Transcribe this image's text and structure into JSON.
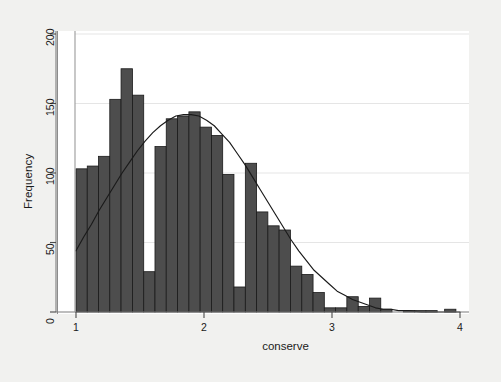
{
  "chart_data": {
    "type": "bar",
    "title": "",
    "subtitle": "",
    "xlabel": "conserve",
    "ylabel": "Frequency",
    "xlim": [
      1.0,
      4.0
    ],
    "ylim": [
      0,
      200
    ],
    "xticks": [
      1,
      2,
      3,
      4
    ],
    "xtick_labels": [
      "1",
      "2",
      "3",
      "4"
    ],
    "yticks": [
      0,
      50,
      100,
      150,
      200
    ],
    "ytick_labels": [
      "0",
      "50",
      "100",
      "150",
      "200"
    ],
    "grid": "horizontal-light",
    "legend": "none",
    "bar_color": "#4d4d4d",
    "bar_edge_color": "#1a1a1a",
    "curve_color": "#1a1a1a",
    "plot_background": "#ffffff",
    "figure_background": "#f1f1ef",
    "bin_width": 0.0455,
    "bin_starts": [
      1.0,
      1.0455,
      1.0909,
      1.1364,
      1.1818,
      1.2273,
      1.2727,
      1.3182,
      1.3636,
      1.4091,
      1.4545,
      1.5,
      1.5455,
      1.5909,
      1.6364,
      1.6818,
      1.7273,
      1.7727,
      1.8182,
      1.8636,
      1.9091,
      1.9545,
      2.0,
      2.0455,
      2.0909,
      2.1364,
      2.1818,
      2.2273,
      2.2727,
      2.3182,
      2.3636,
      2.4091,
      2.4545,
      2.5,
      2.5455,
      2.5909,
      2.6364,
      2.6818,
      2.7273,
      2.7727,
      2.8182,
      2.8636,
      2.9091,
      2.9545,
      3.0,
      3.0455,
      3.0909,
      3.1364,
      3.1818,
      3.2273,
      3.2727,
      3.3182,
      3.3636,
      3.4091,
      3.4545,
      3.5,
      3.5455,
      3.5909,
      3.6364,
      3.6818,
      3.7273,
      3.7727,
      3.8182,
      3.8636,
      3.9091,
      3.9545
    ],
    "values": [
      103,
      105,
      112,
      153,
      175,
      156,
      29,
      119,
      139,
      141,
      144,
      133,
      127,
      99,
      18,
      107,
      72,
      62,
      59,
      33,
      27,
      14,
      3,
      3,
      11,
      4,
      10,
      2,
      1,
      1,
      1,
      2,
      1,
      1
    ],
    "bars": [
      {
        "x0": 1.0,
        "x1": 1.088,
        "height": 103
      },
      {
        "x0": 1.088,
        "x1": 1.176,
        "height": 105
      },
      {
        "x0": 1.176,
        "x1": 1.264,
        "height": 112
      },
      {
        "x0": 1.264,
        "x1": 1.352,
        "height": 153
      },
      {
        "x0": 1.352,
        "x1": 1.441,
        "height": 175
      },
      {
        "x0": 1.441,
        "x1": 1.529,
        "height": 156
      },
      {
        "x0": 1.529,
        "x1": 1.617,
        "height": 29
      },
      {
        "x0": 1.617,
        "x1": 1.705,
        "height": 119
      },
      {
        "x0": 1.705,
        "x1": 1.793,
        "height": 139
      },
      {
        "x0": 1.793,
        "x1": 1.882,
        "height": 141
      },
      {
        "x0": 1.882,
        "x1": 1.97,
        "height": 144
      },
      {
        "x0": 1.97,
        "x1": 2.058,
        "height": 133
      },
      {
        "x0": 2.058,
        "x1": 2.146,
        "height": 127
      },
      {
        "x0": 2.146,
        "x1": 2.234,
        "height": 99
      },
      {
        "x0": 2.234,
        "x1": 2.323,
        "height": 18
      },
      {
        "x0": 2.323,
        "x1": 2.411,
        "height": 107
      },
      {
        "x0": 2.411,
        "x1": 2.499,
        "height": 72
      },
      {
        "x0": 2.499,
        "x1": 2.587,
        "height": 62
      },
      {
        "x0": 2.587,
        "x1": 2.675,
        "height": 59
      },
      {
        "x0": 2.675,
        "x1": 2.764,
        "height": 33
      },
      {
        "x0": 2.764,
        "x1": 2.852,
        "height": 27
      },
      {
        "x0": 2.852,
        "x1": 2.94,
        "height": 14
      },
      {
        "x0": 2.94,
        "x1": 3.028,
        "height": 3
      },
      {
        "x0": 3.028,
        "x1": 3.116,
        "height": 3
      },
      {
        "x0": 3.116,
        "x1": 3.205,
        "height": 11
      },
      {
        "x0": 3.205,
        "x1": 3.293,
        "height": 4
      },
      {
        "x0": 3.293,
        "x1": 3.381,
        "height": 10
      },
      {
        "x0": 3.381,
        "x1": 3.469,
        "height": 2
      },
      {
        "x0": 3.557,
        "x1": 3.646,
        "height": 1
      },
      {
        "x0": 3.646,
        "x1": 3.734,
        "height": 1
      },
      {
        "x0": 3.734,
        "x1": 3.822,
        "height": 1
      },
      {
        "x0": 3.88,
        "x1": 3.968,
        "height": 2
      }
    ],
    "overlay_curve": {
      "name": "normal-density",
      "points": [
        {
          "x": 1.0,
          "y": 44
        },
        {
          "x": 1.06,
          "y": 54
        },
        {
          "x": 1.12,
          "y": 63
        },
        {
          "x": 1.18,
          "y": 73
        },
        {
          "x": 1.24,
          "y": 82
        },
        {
          "x": 1.3,
          "y": 91
        },
        {
          "x": 1.36,
          "y": 100
        },
        {
          "x": 1.42,
          "y": 108
        },
        {
          "x": 1.48,
          "y": 116
        },
        {
          "x": 1.54,
          "y": 123
        },
        {
          "x": 1.6,
          "y": 129
        },
        {
          "x": 1.66,
          "y": 134
        },
        {
          "x": 1.72,
          "y": 138
        },
        {
          "x": 1.78,
          "y": 141
        },
        {
          "x": 1.84,
          "y": 142
        },
        {
          "x": 1.9,
          "y": 142
        },
        {
          "x": 1.96,
          "y": 141
        },
        {
          "x": 2.02,
          "y": 138
        },
        {
          "x": 2.08,
          "y": 134
        },
        {
          "x": 2.14,
          "y": 128
        },
        {
          "x": 2.2,
          "y": 122
        },
        {
          "x": 2.26,
          "y": 114
        },
        {
          "x": 2.32,
          "y": 106
        },
        {
          "x": 2.38,
          "y": 97
        },
        {
          "x": 2.44,
          "y": 88
        },
        {
          "x": 2.5,
          "y": 79
        },
        {
          "x": 2.56,
          "y": 70
        },
        {
          "x": 2.62,
          "y": 61
        },
        {
          "x": 2.68,
          "y": 52
        },
        {
          "x": 2.74,
          "y": 44
        },
        {
          "x": 2.8,
          "y": 37
        },
        {
          "x": 2.86,
          "y": 30
        },
        {
          "x": 2.92,
          "y": 25
        },
        {
          "x": 2.98,
          "y": 20
        },
        {
          "x": 3.04,
          "y": 15
        },
        {
          "x": 3.1,
          "y": 12
        },
        {
          "x": 3.16,
          "y": 9
        },
        {
          "x": 3.22,
          "y": 7
        },
        {
          "x": 3.28,
          "y": 5
        },
        {
          "x": 3.34,
          "y": 3
        },
        {
          "x": 3.4,
          "y": 2
        },
        {
          "x": 3.46,
          "y": 2
        },
        {
          "x": 3.52,
          "y": 1
        },
        {
          "x": 3.6,
          "y": 1
        },
        {
          "x": 3.7,
          "y": 0
        },
        {
          "x": 3.85,
          "y": 0
        },
        {
          "x": 4.0,
          "y": 0
        }
      ]
    }
  }
}
